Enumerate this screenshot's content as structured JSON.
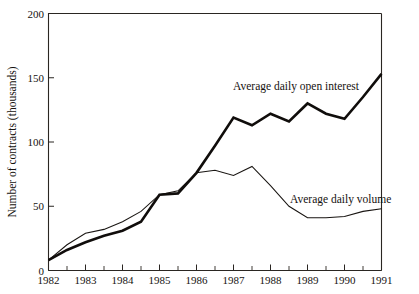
{
  "chart_data": {
    "type": "line",
    "title": "",
    "xlabel": "",
    "ylabel": "Number of contracts (thousands)",
    "xlim": [
      1982,
      1991
    ],
    "ylim": [
      0,
      200
    ],
    "grid": false,
    "legend_position": "inline-annotations",
    "x_tick_labels": [
      "1982",
      "1983",
      "1984",
      "1985",
      "1986",
      "1987",
      "1988",
      "1989",
      "1990",
      "1991"
    ],
    "y_tick_labels": [
      "0",
      "50",
      "100",
      "150",
      "200"
    ],
    "x_minor_ticks_per_interval": 1,
    "x": [
      1982,
      1982.5,
      1983,
      1983.5,
      1984,
      1984.5,
      1985,
      1985.5,
      1986,
      1986.5,
      1987,
      1987.5,
      1988,
      1988.5,
      1989,
      1989.5,
      1990,
      1990.5,
      1991
    ],
    "series": [
      {
        "name": "Average daily open interest",
        "style": "thick",
        "values": [
          8,
          16,
          22,
          27,
          31,
          38,
          59,
          60,
          76,
          97,
          119,
          113,
          122,
          116,
          130,
          122,
          118,
          135,
          153
        ]
      },
      {
        "name": "Average daily volume",
        "style": "thin",
        "values": [
          8,
          20,
          29,
          32,
          38,
          46,
          59,
          62,
          76,
          78,
          74,
          81,
          66,
          50,
          41,
          41,
          42,
          46,
          48
        ]
      }
    ],
    "annotations": [
      {
        "text": "Average daily open interest",
        "x_px": 233,
        "y_px": 90
      },
      {
        "text": "Average daily volume",
        "x_px": 290,
        "y_px": 203
      }
    ]
  },
  "colors": {
    "background": "#ffffff",
    "axis": "#2a2622",
    "text": "#16120f",
    "series_thick": "#100d0b",
    "series_thin": "#191512"
  }
}
